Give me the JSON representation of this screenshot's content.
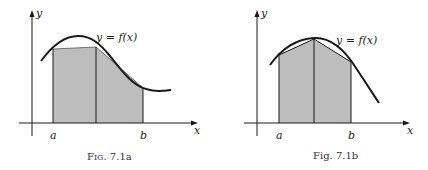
{
  "figures": [
    {
      "id": "7.1a",
      "caption": "Fig. 7.1a",
      "caption_prefix": "F",
      "caption_smallcaps": "IG",
      "caption_rest": ". 7.1a",
      "curve_label": "y = f(x)",
      "axis_x_label": "x",
      "axis_y_label": "y",
      "point_a": "a",
      "point_b": "b",
      "description": "Area under y=f(x) from a to b approximated by two trapezoids (shaded gray)"
    },
    {
      "id": "7.1b",
      "caption": "Fig. 7.1b",
      "curve_label": "y = f(x)",
      "axis_x_label": "x",
      "axis_y_label": "y",
      "point_a": "a",
      "point_b": "b",
      "description": "Area under y=f(x) from a to b approximated by two trapezoids with chords below concave curve"
    }
  ],
  "colors": {
    "shade": "#bdbdbd",
    "ink": "#1a1a1a"
  }
}
